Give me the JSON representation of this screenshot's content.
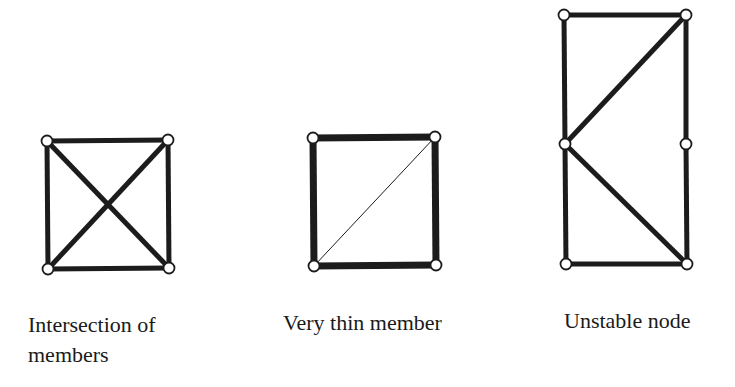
{
  "figures": [
    {
      "id": "intersection",
      "caption_line1": "Intersection of",
      "caption_line2": "members",
      "nodes": [
        [
          47,
          141
        ],
        [
          168,
          140
        ],
        [
          48,
          269
        ],
        [
          169,
          268
        ]
      ],
      "members": [
        {
          "from": 0,
          "to": 1,
          "width": 5
        },
        {
          "from": 0,
          "to": 2,
          "width": 5
        },
        {
          "from": 1,
          "to": 3,
          "width": 5
        },
        {
          "from": 2,
          "to": 3,
          "width": 5
        },
        {
          "from": 0,
          "to": 3,
          "width": 5
        },
        {
          "from": 1,
          "to": 2,
          "width": 5
        }
      ]
    },
    {
      "id": "thin-member",
      "caption_line1": "Very thin member",
      "caption_line2": "",
      "nodes": [
        [
          313,
          138
        ],
        [
          435,
          137
        ],
        [
          314,
          266
        ],
        [
          436,
          265
        ]
      ],
      "members": [
        {
          "from": 0,
          "to": 1,
          "width": 7
        },
        {
          "from": 0,
          "to": 2,
          "width": 7
        },
        {
          "from": 1,
          "to": 3,
          "width": 7
        },
        {
          "from": 2,
          "to": 3,
          "width": 7
        },
        {
          "from": 2,
          "to": 1,
          "width": 1
        }
      ]
    },
    {
      "id": "unstable-node",
      "caption_line1": "Unstable node",
      "caption_line2": "",
      "nodes": [
        [
          564,
          15
        ],
        [
          686,
          15
        ],
        [
          565,
          144
        ],
        [
          686,
          144
        ],
        [
          566,
          264
        ],
        [
          687,
          264
        ]
      ],
      "members": [
        {
          "from": 0,
          "to": 1,
          "width": 5
        },
        {
          "from": 0,
          "to": 2,
          "width": 5
        },
        {
          "from": 2,
          "to": 4,
          "width": 5
        },
        {
          "from": 1,
          "to": 3,
          "width": 5
        },
        {
          "from": 3,
          "to": 5,
          "width": 5
        },
        {
          "from": 4,
          "to": 5,
          "width": 5
        },
        {
          "from": 1,
          "to": 2,
          "width": 5
        },
        {
          "from": 2,
          "to": 5,
          "width": 5
        }
      ]
    }
  ],
  "style": {
    "stroke": "#1c1c1c",
    "node_fill": "#ffffff",
    "node_radius": 5.5
  }
}
